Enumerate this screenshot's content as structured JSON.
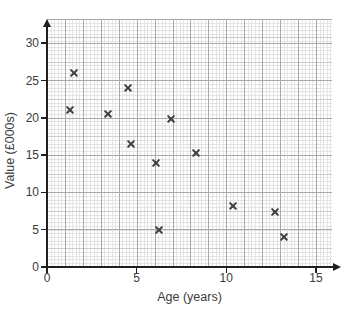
{
  "colors": {
    "background": "#ffffff",
    "axis": "#1f1f1f",
    "marker": "#3f3f3f",
    "grid_fine": "#e4e4e4",
    "grid_major": "#a9a9a9"
  },
  "chart_data": {
    "type": "scatter",
    "title": "",
    "xlabel": "Age (years)",
    "ylabel": "Value (£000s)",
    "xlim": [
      0,
      15.9
    ],
    "ylim": [
      0,
      33.2
    ],
    "x_ticks": [
      0,
      5,
      10,
      15
    ],
    "y_ticks": [
      0,
      5,
      10,
      15,
      20,
      25,
      30
    ],
    "grid": "fine graph-paper grid on",
    "legend": "none",
    "marker": "x",
    "points": [
      {
        "x": 1.5,
        "y": 26
      },
      {
        "x": 1.3,
        "y": 21
      },
      {
        "x": 3.4,
        "y": 20.5
      },
      {
        "x": 4.5,
        "y": 24
      },
      {
        "x": 4.7,
        "y": 16.5
      },
      {
        "x": 6.1,
        "y": 14
      },
      {
        "x": 6.25,
        "y": 5
      },
      {
        "x": 6.9,
        "y": 19.8
      },
      {
        "x": 8.3,
        "y": 15.3
      },
      {
        "x": 10.4,
        "y": 8.2
      },
      {
        "x": 12.7,
        "y": 7.4
      },
      {
        "x": 13.2,
        "y": 4
      }
    ]
  }
}
